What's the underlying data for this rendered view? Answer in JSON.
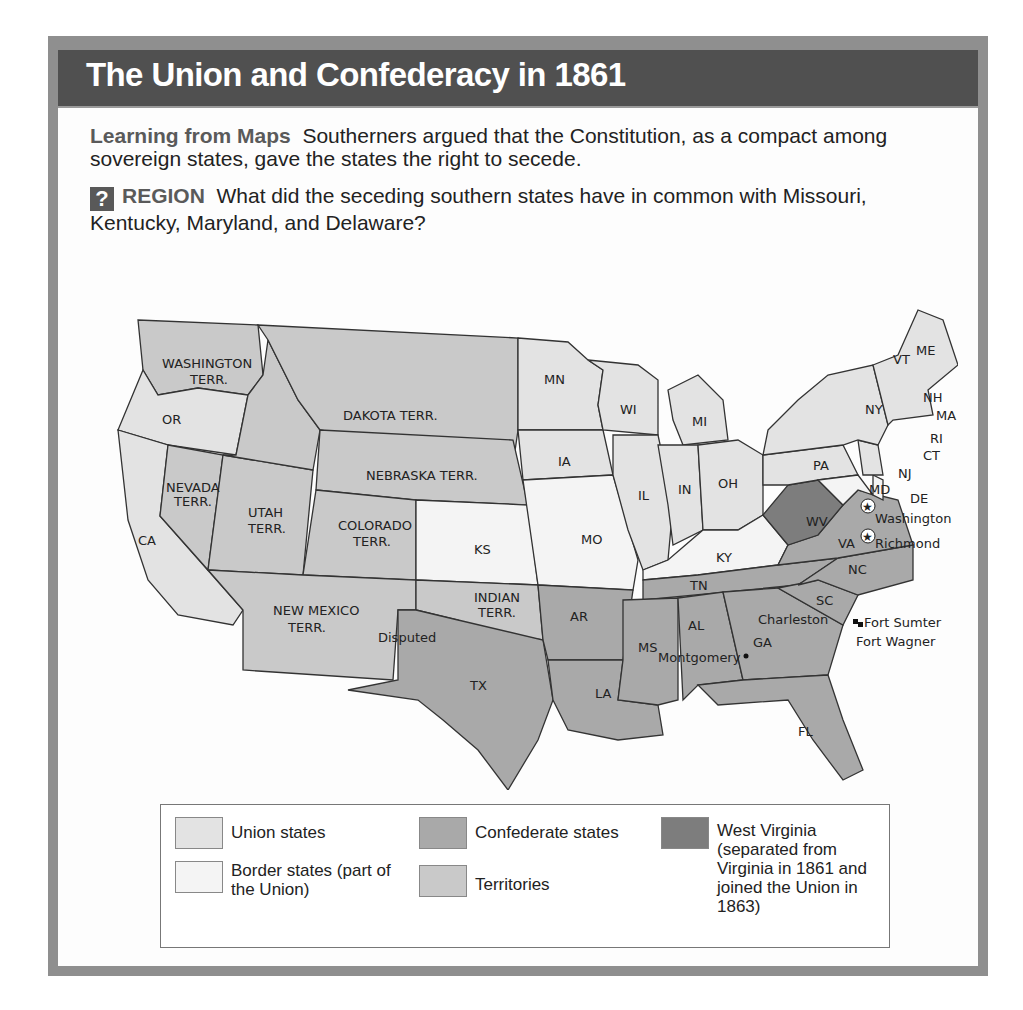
{
  "title": "The Union and Confederacy in 1861",
  "caption": {
    "heading": "Learning from Maps",
    "text": "Southerners argued that the Constitution, as a compact among sovereign states, gave the states the right to secede."
  },
  "question": {
    "icon": "?",
    "heading": "REGION",
    "text": "What did the seceding southern states have in common with Missouri, Kentucky, Maryland, and Delaware?"
  },
  "colors": {
    "union": "#e3e3e3",
    "border": "#f4f4f4",
    "confederate": "#a9a9a9",
    "territory": "#c9c9c9",
    "west_virginia": "#7d7d7d"
  },
  "map": {
    "labels": {
      "wa": "WASHINGTON",
      "wa2": "TERR.",
      "or": "OR",
      "ca": "CA",
      "nv": "NEVADA",
      "nv2": "TERR.",
      "ut": "UTAH",
      "ut2": "TERR.",
      "dk": "DAKOTA TERR.",
      "ne": "NEBRASKA TERR.",
      "co": "COLORADO",
      "co2": "TERR.",
      "nm": "NEW MEXICO",
      "nm2": "TERR.",
      "disputed": "Disputed",
      "ind": "INDIAN",
      "ind2": "TERR.",
      "ks": "KS",
      "tx": "TX",
      "mn": "MN",
      "ia": "IA",
      "mo": "MO",
      "ar": "AR",
      "la": "LA",
      "wi": "WI",
      "il": "IL",
      "mi": "MI",
      "in": "IN",
      "oh": "OH",
      "ky": "KY",
      "tn": "TN",
      "ms": "MS",
      "al": "AL",
      "ga": "GA",
      "fl": "FL",
      "sc": "SC",
      "nc": "NC",
      "va": "VA",
      "wv": "WV",
      "pa": "PA",
      "ny": "NY",
      "md": "MD",
      "de": "DE",
      "nj": "NJ",
      "ct": "CT",
      "ri": "RI",
      "ma": "MA",
      "nh": "NH",
      "vt": "VT",
      "me": "ME"
    },
    "cities": {
      "washington": "Washington",
      "richmond": "Richmond",
      "montgomery": "Montgomery",
      "charleston": "Charleston",
      "fort_sumter": "Fort Sumter",
      "fort_wagner": "Fort Wagner"
    }
  },
  "legend": [
    {
      "label": "Union states"
    },
    {
      "label": "Border states (part of the Union)"
    },
    {
      "label": "Confederate states"
    },
    {
      "label": "Territories"
    },
    {
      "label": "West Virginia (separated from Virginia in 1861 and joined the Union in 1863)"
    }
  ]
}
